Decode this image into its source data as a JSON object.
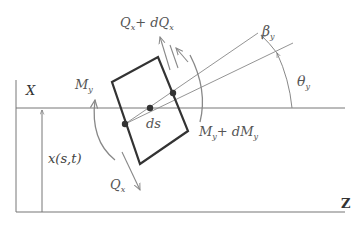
{
  "diagram": {
    "type": "beam-element-free-body-diagram",
    "axes": {
      "vertical_label": "X",
      "horizontal_label": "Z"
    },
    "labels": {
      "shear_top": "Q",
      "shear_top_sub": "x",
      "shear_top_plus": "+ dQ",
      "shear_top_plus_sub": "x",
      "shear_bottom": "Q",
      "shear_bottom_sub": "x",
      "moment_left": "M",
      "moment_left_sub": "y",
      "moment_right": "M",
      "moment_right_sub": "y",
      "moment_right_plus": "+ dM",
      "moment_right_plus_sub": "y",
      "element": "ds",
      "displacement": "x(s,t)",
      "angle_theta": "θ",
      "angle_theta_sub": "y",
      "angle_beta": "β",
      "angle_beta_sub": "y"
    },
    "colors": {
      "element_stroke": "#333333",
      "line": "#777777",
      "arrow": "#888888",
      "text": "#555555"
    }
  }
}
